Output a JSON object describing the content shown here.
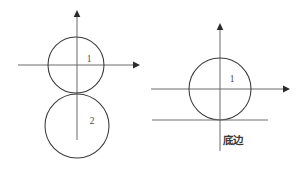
{
  "figure": {
    "background_color": "#ffffff",
    "stroke_color": "#3a3a3a",
    "axis_color": "#6b6b6b",
    "width": 306,
    "height": 170
  },
  "left_panel": {
    "name": "left-figure",
    "axes": {
      "x_axis": {
        "label": "",
        "x1": 18,
        "y1": 65,
        "x2": 137,
        "y2": 65,
        "arrow": "right"
      },
      "y_axis": {
        "label": "",
        "x1": 77,
        "y1": 140,
        "x2": 77,
        "y2": 12,
        "arrow": "up"
      },
      "origin": {
        "x": 77,
        "y": 65
      }
    },
    "circles": [
      {
        "label": "1",
        "cx": 76,
        "cy": 65,
        "r": 28,
        "label_x": 89,
        "label_y": 62
      },
      {
        "label": "2",
        "cx": 77,
        "cy": 126,
        "r": 32,
        "label_x": 92,
        "label_y": 124
      }
    ]
  },
  "right_panel": {
    "name": "right-figure",
    "axes": {
      "x_axis": {
        "label": "",
        "x1": 151,
        "y1": 89,
        "x2": 288,
        "y2": 89,
        "arrow": "right"
      },
      "y_axis": {
        "label": "",
        "x1": 220,
        "y1": 151,
        "x2": 220,
        "y2": 25,
        "arrow": "up"
      },
      "origin": {
        "x": 220,
        "y": 89
      }
    },
    "circles": [
      {
        "label": "1",
        "cx": 220,
        "cy": 89,
        "r": 31,
        "label_x": 232,
        "label_y": 82
      }
    ],
    "base_line": {
      "x1": 152,
      "y1": 120,
      "x2": 268,
      "y2": 120
    },
    "base_label": {
      "text": "底边",
      "x": 233,
      "y": 144
    }
  }
}
